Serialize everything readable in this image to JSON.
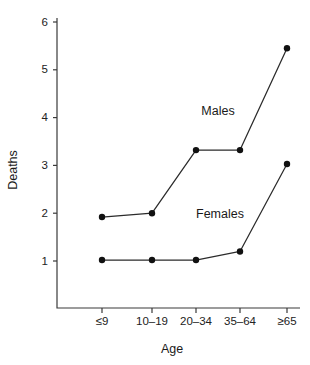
{
  "chart_data": {
    "type": "line",
    "title": "",
    "xlabel": "Age",
    "ylabel": "Deaths",
    "categories": [
      "≤9",
      "10–19",
      "20–34",
      "35–64",
      "≥65"
    ],
    "ylim": [
      0,
      6
    ],
    "yticks": [
      1,
      2,
      3,
      4,
      5,
      6
    ],
    "ytick_labels": [
      "1",
      "2",
      "3",
      "4",
      "5",
      "6"
    ],
    "grid": false,
    "legend_position": "inline-annotations",
    "series": [
      {
        "name": "Males",
        "values": [
          1.92,
          2.0,
          3.32,
          3.32,
          5.45
        ],
        "color": "#111111",
        "marker": "filled-circle",
        "annotation": {
          "text": "Males",
          "x_px": 218,
          "y_px": 115
        }
      },
      {
        "name": "Females",
        "values": [
          1.02,
          1.02,
          1.02,
          1.2,
          3.03
        ],
        "color": "#111111",
        "marker": "filled-circle",
        "annotation": {
          "text": "Females",
          "x_px": 220,
          "y_px": 218
        }
      }
    ]
  },
  "axes": {
    "y_title": "Deaths",
    "x_title": "Age",
    "y_tick_labels": [
      "1",
      "2",
      "3",
      "4",
      "5",
      "6"
    ],
    "x_tick_labels": [
      "≤9",
      "10–19",
      "20–34",
      "35–64",
      "≥65"
    ]
  },
  "annotations": {
    "males_label": "Males",
    "females_label": "Females"
  },
  "colors": {
    "background": "#ffffff",
    "axis": "#3a3a3a",
    "line": "#2b2b2b",
    "marker": "#111111",
    "text": "#1a1a1a"
  }
}
